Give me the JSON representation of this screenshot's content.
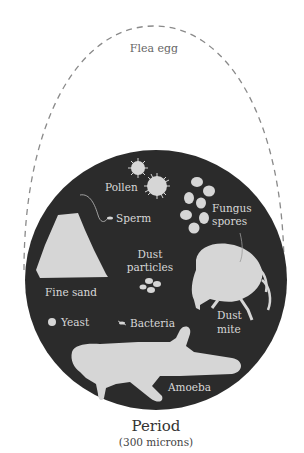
{
  "diagram": {
    "outer_label": "Flea egg",
    "title": "Period",
    "subtitle": "(300 microns)",
    "items": [
      {
        "id": "pollen",
        "label": "Pollen"
      },
      {
        "id": "fungus_spores",
        "label_line1": "Fungus",
        "label_line2": "spores"
      },
      {
        "id": "sperm",
        "label": "Sperm"
      },
      {
        "id": "fine_sand",
        "label": "Fine sand"
      },
      {
        "id": "dust_particles",
        "label_line1": "Dust",
        "label_line2": "particles"
      },
      {
        "id": "dust_mite",
        "label_line1": "Dust",
        "label_line2": "mite"
      },
      {
        "id": "yeast",
        "label": "Yeast"
      },
      {
        "id": "bacteria",
        "label": "Bacteria"
      },
      {
        "id": "amoeba",
        "label": "Amoeba"
      }
    ],
    "colors": {
      "circle_fill": "#2b2b2b",
      "shape_fill": "#d6d6d6",
      "dashed_outline": "#8a8a8a",
      "background": "#ffffff"
    }
  }
}
